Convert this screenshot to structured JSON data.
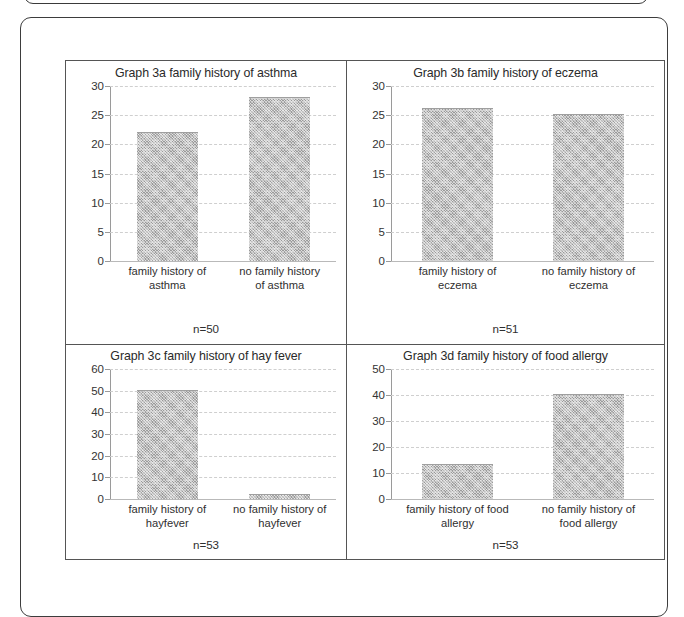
{
  "chart_data": [
    {
      "id": "graph-3a",
      "type": "bar",
      "title": "Graph 3a family history of asthma",
      "categories": [
        "family history of asthma",
        "no family history of asthma"
      ],
      "values": [
        22,
        28
      ],
      "ylim": [
        0,
        30
      ],
      "yticks": [
        0,
        5,
        10,
        15,
        20,
        25,
        30
      ],
      "xlabel": "",
      "ylabel": "",
      "annotation": "n=50",
      "grid": true,
      "legend": "none"
    },
    {
      "id": "graph-3b",
      "type": "bar",
      "title": "Graph 3b family history of eczema",
      "categories": [
        "family history of eczema",
        "no family history of eczema"
      ],
      "values": [
        26,
        25
      ],
      "ylim": [
        0,
        30
      ],
      "yticks": [
        0,
        5,
        10,
        15,
        20,
        25,
        30
      ],
      "xlabel": "",
      "ylabel": "",
      "annotation": "n=51",
      "grid": true,
      "legend": "none"
    },
    {
      "id": "graph-3c",
      "type": "bar",
      "title": "Graph 3c family history of hay fever",
      "categories": [
        "family history of hayfever",
        "no family history of hayfever"
      ],
      "values": [
        50,
        2
      ],
      "ylim": [
        0,
        60
      ],
      "yticks": [
        0,
        10,
        20,
        30,
        40,
        50,
        60
      ],
      "xlabel": "",
      "ylabel": "",
      "annotation": "n=53",
      "grid": true,
      "legend": "none"
    },
    {
      "id": "graph-3d",
      "type": "bar",
      "title": "Graph 3d family history of food allergy",
      "categories": [
        "family history of food allergy",
        "no family history of food allergy"
      ],
      "values": [
        13,
        40
      ],
      "ylim": [
        0,
        50
      ],
      "yticks": [
        0,
        10,
        20,
        30,
        40,
        50
      ],
      "xlabel": "",
      "ylabel": "",
      "annotation": "n=53",
      "grid": true,
      "legend": "none"
    }
  ],
  "figures": {
    "a": {
      "title": "Graph 3a family history of asthma",
      "n": "n=50",
      "cat1_line1": "family history of",
      "cat1_line2": "asthma",
      "cat2_line1": "no family history",
      "cat2_line2": "of asthma",
      "ticks": [
        "30",
        "25",
        "20",
        "15",
        "10",
        "5",
        "0"
      ]
    },
    "b": {
      "title": "Graph 3b family history of eczema",
      "n": "n=51",
      "cat1_line1": "family history of",
      "cat1_line2": "eczema",
      "cat2_line1": "no family history of",
      "cat2_line2": "eczema",
      "ticks": [
        "30",
        "25",
        "20",
        "15",
        "10",
        "5",
        "0"
      ]
    },
    "c": {
      "title": "Graph 3c family history of hay fever",
      "n": "n=53",
      "cat1_line1": "family history of",
      "cat1_line2": "hayfever",
      "cat2_line1": "no family history of",
      "cat2_line2": "hayfever",
      "ticks": [
        "60",
        "50",
        "40",
        "30",
        "20",
        "10",
        "0"
      ]
    },
    "d": {
      "title": "Graph 3d family history of food allergy",
      "n": "n=53",
      "cat1_line1": "family history of food",
      "cat1_line2": "allergy",
      "cat2_line1": "no family history of",
      "cat2_line2": "food allergy",
      "ticks": [
        "50",
        "40",
        "30",
        "20",
        "10",
        "0"
      ]
    }
  },
  "colors": {
    "bar_fill": "#bdbdbd",
    "gridline": "#cfcfcf",
    "axis": "#9a9a9a",
    "border": "#555555",
    "text": "#2b2b2b"
  }
}
